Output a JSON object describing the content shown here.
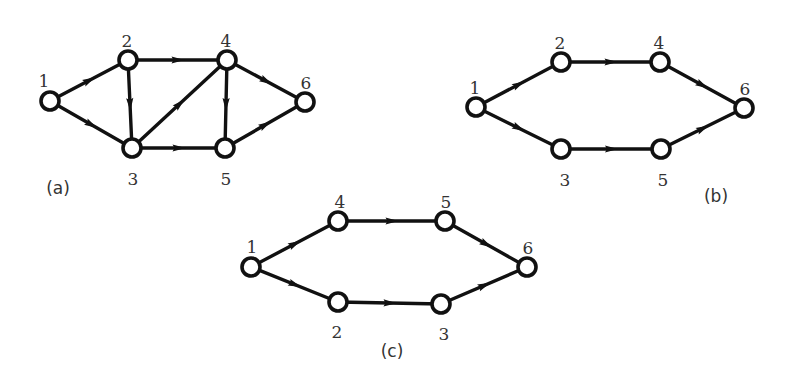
{
  "figure": {
    "colors": {
      "edge": "#111111",
      "node_fill": "#ffffff",
      "node_stroke": "#111111",
      "label": "#333333"
    },
    "node_radius": 9,
    "panels": [
      {
        "id": "a",
        "label": "(a)",
        "label_pos": [
          58,
          194
        ],
        "nodes": [
          {
            "id": "1",
            "label": "1",
            "x": 50,
            "y": 101,
            "lx": 44,
            "ly": 82
          },
          {
            "id": "2",
            "label": "2",
            "x": 128,
            "y": 60,
            "lx": 127,
            "ly": 42
          },
          {
            "id": "3",
            "label": "3",
            "x": 132,
            "y": 148,
            "lx": 133,
            "ly": 180
          },
          {
            "id": "4",
            "label": "4",
            "x": 227,
            "y": 60,
            "lx": 226,
            "ly": 42
          },
          {
            "id": "5",
            "label": "5",
            "x": 225,
            "y": 148,
            "lx": 226,
            "ly": 180
          },
          {
            "id": "6",
            "label": "6",
            "x": 305,
            "y": 102,
            "lx": 306,
            "ly": 84
          }
        ],
        "edges": [
          {
            "from": "1",
            "to": "2"
          },
          {
            "from": "1",
            "to": "3"
          },
          {
            "from": "2",
            "to": "3"
          },
          {
            "from": "2",
            "to": "4"
          },
          {
            "from": "3",
            "to": "4"
          },
          {
            "from": "3",
            "to": "5"
          },
          {
            "from": "4",
            "to": "5"
          },
          {
            "from": "4",
            "to": "6"
          },
          {
            "from": "5",
            "to": "6"
          }
        ]
      },
      {
        "id": "b",
        "label": "(b)",
        "label_pos": [
          716,
          202
        ],
        "nodes": [
          {
            "id": "1",
            "label": "1",
            "x": 476,
            "y": 107,
            "lx": 475,
            "ly": 89
          },
          {
            "id": "2",
            "label": "2",
            "x": 561,
            "y": 62,
            "lx": 560,
            "ly": 44
          },
          {
            "id": "3",
            "label": "3",
            "x": 561,
            "y": 149,
            "lx": 565,
            "ly": 181
          },
          {
            "id": "4",
            "label": "4",
            "x": 660,
            "y": 62,
            "lx": 659,
            "ly": 44
          },
          {
            "id": "5",
            "label": "5",
            "x": 661,
            "y": 149,
            "lx": 663,
            "ly": 181
          },
          {
            "id": "6",
            "label": "6",
            "x": 744,
            "y": 108,
            "lx": 745,
            "ly": 90
          }
        ],
        "edges": [
          {
            "from": "1",
            "to": "2"
          },
          {
            "from": "1",
            "to": "3"
          },
          {
            "from": "2",
            "to": "4"
          },
          {
            "from": "3",
            "to": "5"
          },
          {
            "from": "4",
            "to": "6"
          },
          {
            "from": "5",
            "to": "6"
          }
        ]
      },
      {
        "id": "c",
        "label": "(c)",
        "label_pos": [
          392,
          357
        ],
        "nodes": [
          {
            "id": "1",
            "label": "1",
            "x": 251,
            "y": 267,
            "lx": 252,
            "ly": 248
          },
          {
            "id": "4",
            "label": "4",
            "x": 338,
            "y": 221,
            "lx": 340,
            "ly": 203
          },
          {
            "id": "5",
            "label": "5",
            "x": 445,
            "y": 221,
            "lx": 446,
            "ly": 203
          },
          {
            "id": "2",
            "label": "2",
            "x": 338,
            "y": 302,
            "lx": 337,
            "ly": 333
          },
          {
            "id": "3",
            "label": "3",
            "x": 441,
            "y": 304,
            "lx": 444,
            "ly": 335
          },
          {
            "id": "6",
            "label": "6",
            "x": 527,
            "y": 267,
            "lx": 528,
            "ly": 249
          }
        ],
        "edges": [
          {
            "from": "1",
            "to": "4"
          },
          {
            "from": "1",
            "to": "2"
          },
          {
            "from": "4",
            "to": "5"
          },
          {
            "from": "2",
            "to": "3"
          },
          {
            "from": "5",
            "to": "6"
          },
          {
            "from": "3",
            "to": "6"
          }
        ]
      }
    ]
  }
}
